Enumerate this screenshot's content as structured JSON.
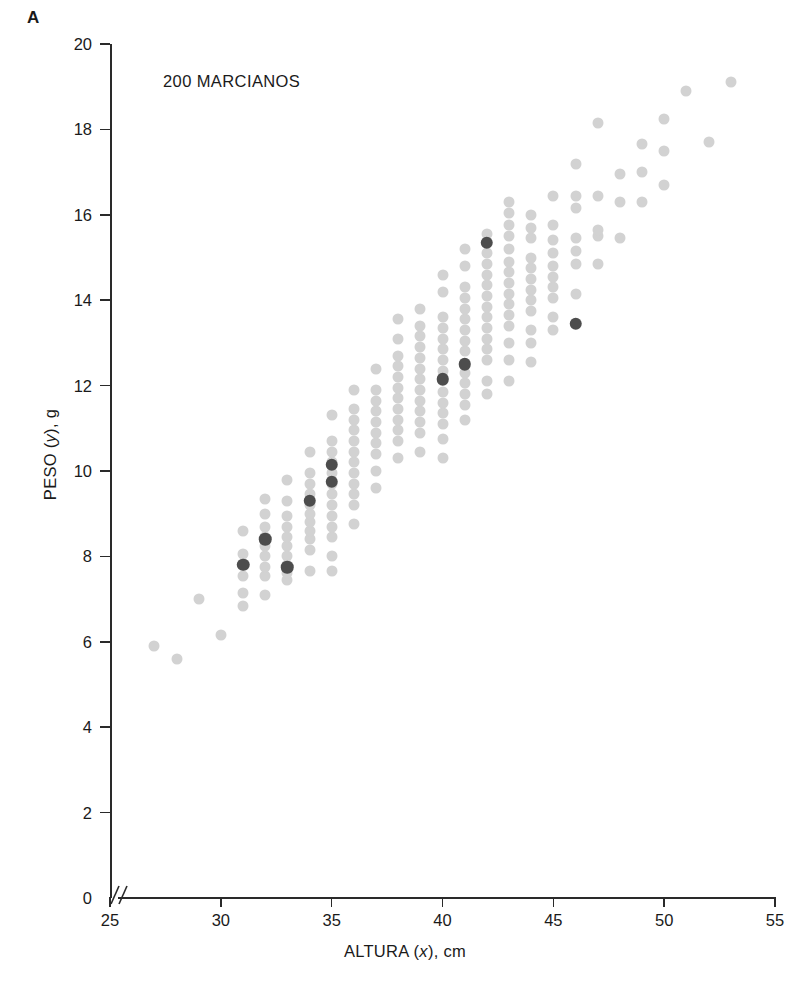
{
  "figure": {
    "panel_label": "A",
    "title": "200 MARCIANOS"
  },
  "axes": {
    "x_title_prefix": "ALTURA (",
    "x_title_var": "x",
    "x_title_suffix": "), cm",
    "y_title_prefix": "PESO (",
    "y_title_var": "y",
    "y_title_suffix": "), g",
    "x_ticks": [
      "25",
      "30",
      "35",
      "40",
      "45",
      "50",
      "55"
    ],
    "y_ticks": [
      "0",
      "2",
      "4",
      "6",
      "8",
      "10",
      "12",
      "14",
      "16",
      "18",
      "20"
    ],
    "axis_break_symbol": "//"
  },
  "colors": {
    "point_light": "#d2d2d2",
    "point_dark": "#4d4d4d",
    "axis": "#2a2a2a",
    "text": "#1a1a1a",
    "background": "#ffffff"
  },
  "chart_data": {
    "type": "scatter",
    "title": "200 MARCIANOS",
    "xlabel": "ALTURA (x), cm",
    "ylabel": "PESO (y), g",
    "xlim": [
      25,
      55
    ],
    "ylim": [
      0,
      20
    ],
    "x_ticks": [
      25,
      30,
      35,
      40,
      45,
      50,
      55
    ],
    "y_ticks": [
      0,
      2,
      4,
      6,
      8,
      10,
      12,
      14,
      16,
      18,
      20
    ],
    "grid": false,
    "legend": null,
    "axis_break_on_x_origin": true,
    "n_points": 200,
    "series": [
      {
        "name": "marcianos",
        "color": "#d2d2d2",
        "marker": "circle",
        "points": [
          [
            27,
            5.9
          ],
          [
            28,
            5.6
          ],
          [
            29,
            7.0
          ],
          [
            30,
            6.15
          ],
          [
            31,
            6.85
          ],
          [
            31,
            7.15
          ],
          [
            31,
            7.55
          ],
          [
            31,
            8.05
          ],
          [
            31,
            8.6
          ],
          [
            32,
            7.1
          ],
          [
            32,
            7.55
          ],
          [
            32,
            7.75
          ],
          [
            32,
            8.0
          ],
          [
            32,
            8.25
          ],
          [
            32,
            8.45
          ],
          [
            32,
            8.7
          ],
          [
            32,
            9.0
          ],
          [
            32,
            9.35
          ],
          [
            33,
            7.45
          ],
          [
            33,
            7.6
          ],
          [
            33,
            7.8
          ],
          [
            33,
            8.0
          ],
          [
            33,
            8.25
          ],
          [
            33,
            8.45
          ],
          [
            33,
            8.7
          ],
          [
            33,
            8.95
          ],
          [
            33,
            9.3
          ],
          [
            33,
            9.8
          ],
          [
            34,
            7.65
          ],
          [
            34,
            8.15
          ],
          [
            34,
            8.4
          ],
          [
            34,
            8.6
          ],
          [
            34,
            8.8
          ],
          [
            34,
            9.0
          ],
          [
            34,
            9.2
          ],
          [
            34,
            9.45
          ],
          [
            34,
            9.7
          ],
          [
            34,
            9.95
          ],
          [
            34,
            10.45
          ],
          [
            35,
            7.65
          ],
          [
            35,
            8.0
          ],
          [
            35,
            8.45
          ],
          [
            35,
            8.7
          ],
          [
            35,
            8.95
          ],
          [
            35,
            9.2
          ],
          [
            35,
            9.45
          ],
          [
            35,
            9.7
          ],
          [
            35,
            9.95
          ],
          [
            35,
            10.2
          ],
          [
            35,
            10.45
          ],
          [
            35,
            10.7
          ],
          [
            35,
            11.3
          ],
          [
            36,
            8.75
          ],
          [
            36,
            9.2
          ],
          [
            36,
            9.45
          ],
          [
            36,
            9.7
          ],
          [
            36,
            9.95
          ],
          [
            36,
            10.2
          ],
          [
            36,
            10.45
          ],
          [
            36,
            10.7
          ],
          [
            36,
            10.95
          ],
          [
            36,
            11.2
          ],
          [
            36,
            11.45
          ],
          [
            36,
            11.9
          ],
          [
            37,
            9.6
          ],
          [
            37,
            10.0
          ],
          [
            37,
            10.4
          ],
          [
            37,
            10.65
          ],
          [
            37,
            10.9
          ],
          [
            37,
            11.15
          ],
          [
            37,
            11.4
          ],
          [
            37,
            11.65
          ],
          [
            37,
            11.9
          ],
          [
            37,
            12.4
          ],
          [
            38,
            10.3
          ],
          [
            38,
            10.7
          ],
          [
            38,
            10.95
          ],
          [
            38,
            11.2
          ],
          [
            38,
            11.45
          ],
          [
            38,
            11.7
          ],
          [
            38,
            11.95
          ],
          [
            38,
            12.2
          ],
          [
            38,
            12.45
          ],
          [
            38,
            12.7
          ],
          [
            38,
            13.1
          ],
          [
            38,
            13.55
          ],
          [
            39,
            10.45
          ],
          [
            39,
            10.9
          ],
          [
            39,
            11.15
          ],
          [
            39,
            11.4
          ],
          [
            39,
            11.65
          ],
          [
            39,
            11.9
          ],
          [
            39,
            12.15
          ],
          [
            39,
            12.4
          ],
          [
            39,
            12.65
          ],
          [
            39,
            12.9
          ],
          [
            39,
            13.15
          ],
          [
            39,
            13.4
          ],
          [
            39,
            13.8
          ],
          [
            40,
            10.3
          ],
          [
            40,
            10.75
          ],
          [
            40,
            11.1
          ],
          [
            40,
            11.35
          ],
          [
            40,
            11.6
          ],
          [
            40,
            11.85
          ],
          [
            40,
            12.35
          ],
          [
            40,
            12.6
          ],
          [
            40,
            12.85
          ],
          [
            40,
            13.1
          ],
          [
            40,
            13.35
          ],
          [
            40,
            13.6
          ],
          [
            40,
            14.2
          ],
          [
            40,
            14.6
          ],
          [
            41,
            11.2
          ],
          [
            41,
            11.55
          ],
          [
            41,
            11.8
          ],
          [
            41,
            12.05
          ],
          [
            41,
            12.3
          ],
          [
            41,
            12.8
          ],
          [
            41,
            13.05
          ],
          [
            41,
            13.3
          ],
          [
            41,
            13.55
          ],
          [
            41,
            13.8
          ],
          [
            41,
            14.05
          ],
          [
            41,
            14.3
          ],
          [
            41,
            14.8
          ],
          [
            41,
            15.2
          ],
          [
            42,
            11.8
          ],
          [
            42,
            12.1
          ],
          [
            42,
            12.6
          ],
          [
            42,
            12.85
          ],
          [
            42,
            13.1
          ],
          [
            42,
            13.35
          ],
          [
            42,
            13.6
          ],
          [
            42,
            13.85
          ],
          [
            42,
            14.1
          ],
          [
            42,
            14.35
          ],
          [
            42,
            14.6
          ],
          [
            42,
            14.85
          ],
          [
            42,
            15.1
          ],
          [
            42,
            15.55
          ],
          [
            43,
            12.1
          ],
          [
            43,
            12.6
          ],
          [
            43,
            13.0
          ],
          [
            43,
            13.4
          ],
          [
            43,
            13.65
          ],
          [
            43,
            13.9
          ],
          [
            43,
            14.15
          ],
          [
            43,
            14.4
          ],
          [
            43,
            14.65
          ],
          [
            43,
            14.9
          ],
          [
            43,
            15.2
          ],
          [
            43,
            15.5
          ],
          [
            43,
            15.75
          ],
          [
            43,
            16.05
          ],
          [
            43,
            16.3
          ],
          [
            44,
            12.55
          ],
          [
            44,
            13.0
          ],
          [
            44,
            13.3
          ],
          [
            44,
            13.75
          ],
          [
            44,
            14.0
          ],
          [
            44,
            14.25
          ],
          [
            44,
            14.5
          ],
          [
            44,
            14.75
          ],
          [
            44,
            15.0
          ],
          [
            44,
            15.45
          ],
          [
            44,
            15.7
          ],
          [
            44,
            16.0
          ],
          [
            45,
            13.3
          ],
          [
            45,
            13.6
          ],
          [
            45,
            14.05
          ],
          [
            45,
            14.3
          ],
          [
            45,
            14.55
          ],
          [
            45,
            14.8
          ],
          [
            45,
            15.1
          ],
          [
            45,
            15.4
          ],
          [
            45,
            15.75
          ],
          [
            45,
            16.45
          ],
          [
            46,
            14.15
          ],
          [
            46,
            14.85
          ],
          [
            46,
            15.15
          ],
          [
            46,
            15.45
          ],
          [
            46,
            16.15
          ],
          [
            46,
            16.45
          ],
          [
            46,
            17.2
          ],
          [
            47,
            14.85
          ],
          [
            47,
            15.5
          ],
          [
            47,
            15.65
          ],
          [
            47,
            16.45
          ],
          [
            47,
            18.15
          ],
          [
            48,
            15.45
          ],
          [
            48,
            16.3
          ],
          [
            48,
            16.95
          ],
          [
            49,
            16.3
          ],
          [
            49,
            17.0
          ],
          [
            49,
            17.65
          ],
          [
            50,
            16.7
          ],
          [
            50,
            17.5
          ],
          [
            50,
            18.25
          ],
          [
            51,
            18.9
          ],
          [
            52,
            17.7
          ],
          [
            53,
            19.1
          ]
        ]
      },
      {
        "name": "medias-condicionales",
        "color": "#4d4d4d",
        "marker": "circle",
        "points": [
          [
            31,
            7.8
          ],
          [
            32,
            8.4
          ],
          [
            33,
            7.75
          ],
          [
            34,
            9.3
          ],
          [
            35,
            10.15
          ],
          [
            35,
            9.75
          ],
          [
            40,
            12.15
          ],
          [
            41,
            12.5
          ],
          [
            42,
            15.35
          ],
          [
            46,
            13.45
          ]
        ]
      }
    ]
  }
}
